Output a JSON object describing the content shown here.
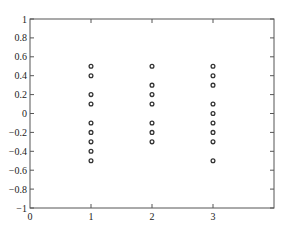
{
  "chart_data": {
    "type": "scatter",
    "title": "",
    "xlabel": "",
    "ylabel": "",
    "xlim": [
      0,
      4
    ],
    "ylim": [
      -1,
      1
    ],
    "grid": false,
    "legend": null,
    "x_ticks": [
      0,
      1,
      2,
      3
    ],
    "x_tick_labels": [
      "0",
      "1",
      "2",
      "3"
    ],
    "y_ticks": [
      1,
      0.8,
      0.6,
      0.4,
      0.2,
      0,
      -0.2,
      -0.4,
      -0.6,
      -0.8,
      -1
    ],
    "y_tick_labels": [
      "1",
      "0.8",
      "0.6",
      "0.4",
      "0.2",
      "0",
      "−0.2",
      "−0.4",
      "−0.6",
      "−0.8",
      "−1"
    ],
    "marker": "open-circle",
    "marker_color": "#333333",
    "series": [
      {
        "name": "group-1",
        "x": 1,
        "values": [
          0.5,
          0.4,
          0.2,
          0.1,
          -0.1,
          -0.2,
          -0.3,
          -0.4,
          -0.5
        ]
      },
      {
        "name": "group-2",
        "x": 2,
        "values": [
          0.5,
          0.3,
          0.2,
          0.1,
          -0.1,
          -0.2,
          -0.3
        ]
      },
      {
        "name": "group-3",
        "x": 3,
        "values": [
          0.5,
          0.4,
          0.3,
          0.1,
          0,
          -0.1,
          -0.2,
          -0.3,
          -0.5
        ]
      }
    ]
  }
}
